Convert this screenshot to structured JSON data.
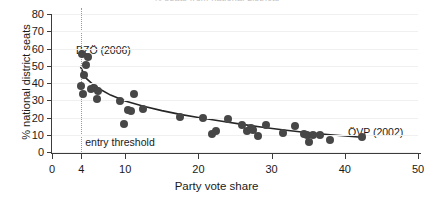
{
  "chart_data": {
    "type": "scatter",
    "title": "% seats from national districts",
    "xlabel": "Party vote share",
    "ylabel": "% national district seats",
    "xlim": [
      0,
      50
    ],
    "ylim": [
      0,
      80
    ],
    "xticks": [
      0,
      4,
      10,
      20,
      30,
      40,
      50
    ],
    "yticks": [
      0,
      10,
      20,
      30,
      40,
      50,
      60,
      70,
      80
    ],
    "grid": true,
    "legend": "none",
    "point_color": "#474747",
    "fit_color": "#262626",
    "grid_color": "#f0f0f0",
    "annotations": [
      {
        "name": "bzoe-label",
        "text": "BZÖ (2006)",
        "x": 4.3,
        "y": 62
      },
      {
        "name": "ovp-label",
        "text": "ÖVP (2002)",
        "x": 42.3,
        "y": 15
      },
      {
        "name": "threshold-label",
        "text": "entry threshold",
        "x": 4.6,
        "y": 2
      }
    ],
    "reference_lines": [
      {
        "name": "entry-threshold",
        "orientation": "vertical",
        "x": 4,
        "style": "dotted"
      }
    ],
    "points": [
      {
        "x": 4.1,
        "y": 57.0
      },
      {
        "x": 4.9,
        "y": 55.0
      },
      {
        "x": 4.6,
        "y": 50.5
      },
      {
        "x": 4.4,
        "y": 44.5
      },
      {
        "x": 4.0,
        "y": 38.0
      },
      {
        "x": 4.3,
        "y": 33.5
      },
      {
        "x": 5.3,
        "y": 36.5
      },
      {
        "x": 5.8,
        "y": 37.0
      },
      {
        "x": 6.3,
        "y": 35.5
      },
      {
        "x": 6.1,
        "y": 31.0
      },
      {
        "x": 9.3,
        "y": 29.5
      },
      {
        "x": 10.4,
        "y": 24.5
      },
      {
        "x": 10.8,
        "y": 23.5
      },
      {
        "x": 11.2,
        "y": 33.5
      },
      {
        "x": 12.4,
        "y": 25.0
      },
      {
        "x": 9.9,
        "y": 16.5
      },
      {
        "x": 17.5,
        "y": 20.5
      },
      {
        "x": 20.6,
        "y": 19.5
      },
      {
        "x": 21.9,
        "y": 10.5
      },
      {
        "x": 22.4,
        "y": 12.0
      },
      {
        "x": 24.0,
        "y": 19.0
      },
      {
        "x": 25.9,
        "y": 15.5
      },
      {
        "x": 26.7,
        "y": 12.0
      },
      {
        "x": 27.2,
        "y": 14.0
      },
      {
        "x": 27.5,
        "y": 12.5
      },
      {
        "x": 28.1,
        "y": 9.5
      },
      {
        "x": 29.2,
        "y": 15.5
      },
      {
        "x": 31.5,
        "y": 11.0
      },
      {
        "x": 33.2,
        "y": 15.0
      },
      {
        "x": 34.4,
        "y": 10.5
      },
      {
        "x": 34.9,
        "y": 10.0
      },
      {
        "x": 35.1,
        "y": 6.0
      },
      {
        "x": 35.6,
        "y": 10.0
      },
      {
        "x": 36.6,
        "y": 10.0
      },
      {
        "x": 38.0,
        "y": 7.0
      },
      {
        "x": 42.3,
        "y": 8.5
      }
    ],
    "fit_curve": [
      {
        "x": 3.9,
        "y": 49.5
      },
      {
        "x": 4.6,
        "y": 43.0
      },
      {
        "x": 5.5,
        "y": 39.5
      },
      {
        "x": 6.5,
        "y": 36.5
      },
      {
        "x": 8.0,
        "y": 33.0
      },
      {
        "x": 10.0,
        "y": 29.5
      },
      {
        "x": 12.5,
        "y": 26.5
      },
      {
        "x": 15.0,
        "y": 24.0
      },
      {
        "x": 17.5,
        "y": 21.8
      },
      {
        "x": 20.0,
        "y": 20.0
      },
      {
        "x": 23.0,
        "y": 18.0
      },
      {
        "x": 26.0,
        "y": 16.0
      },
      {
        "x": 29.0,
        "y": 14.2
      },
      {
        "x": 32.0,
        "y": 12.6
      },
      {
        "x": 35.0,
        "y": 11.2
      },
      {
        "x": 38.0,
        "y": 10.0
      },
      {
        "x": 42.3,
        "y": 8.6
      }
    ]
  }
}
